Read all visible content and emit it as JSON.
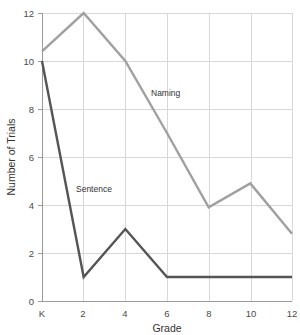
{
  "chart_data": {
    "type": "line",
    "title": "",
    "xlabel": "Grade",
    "ylabel": "Number of Trials",
    "x": [
      "K",
      "2",
      "4",
      "6",
      "8",
      "10",
      "12"
    ],
    "x_numeric": [
      0,
      2,
      4,
      6,
      8,
      10,
      12
    ],
    "xtick_labels": [
      "K",
      "2",
      "4",
      "6",
      "8",
      "10",
      "12"
    ],
    "ytick_labels": [
      "0",
      "2",
      "4",
      "6",
      "8",
      "10",
      "12"
    ],
    "ytick_values": [
      0,
      2,
      4,
      6,
      8,
      10,
      12
    ],
    "ylim": [
      0,
      12
    ],
    "xlim": [
      0,
      12
    ],
    "grid": true,
    "legend": "inline-labels",
    "series": [
      {
        "name": "Naming",
        "color": "#a0a0a0",
        "values": [
          10.4,
          12,
          10,
          7,
          3.9,
          4.9,
          2.8
        ],
        "label_x": "4.7",
        "label_y": "8.4"
      },
      {
        "name": "Sentence",
        "color": "#555555",
        "values": [
          10,
          1,
          3,
          1,
          1,
          1,
          1
        ],
        "label_x": "1.5",
        "label_y": "4.5"
      }
    ],
    "colors": {
      "naming": "#a0a0a0",
      "sentence": "#555555",
      "grid": "#d8d8d8",
      "axis": "#9a9a9a",
      "text": "#3a3a3a",
      "background": "#ffffff"
    }
  },
  "axis": {
    "y_title": "Number of Trials",
    "x_title": "Grade",
    "y_ticks": [
      "12",
      "10",
      "8",
      "6",
      "4",
      "2",
      "0"
    ],
    "x_ticks": [
      "K",
      "2",
      "4",
      "6",
      "8",
      "10",
      "12"
    ]
  },
  "labels": {
    "naming": "Naming",
    "sentence": "Sentence"
  }
}
